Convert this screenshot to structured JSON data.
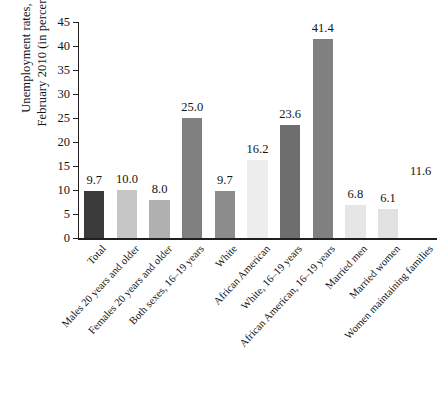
{
  "chart_data": {
    "type": "bar",
    "title": "",
    "xlabel": "",
    "ylabel": "Unemployment rates, February 2010 (in percent)",
    "ylabel_lines": [
      "Unemployment rates,",
      "February 2010 (in percent)"
    ],
    "ylim": [
      0,
      45
    ],
    "yticks": [
      0,
      5,
      10,
      15,
      20,
      25,
      30,
      35,
      40,
      45
    ],
    "ytick_labels": [
      "0",
      "5",
      "10",
      "15",
      "20",
      "25",
      "30",
      "35",
      "40",
      "45"
    ],
    "grid": false,
    "legend": false,
    "categories": [
      "Total",
      "Males 20 years and older",
      "Females 20 years and older",
      "Both sexes, 16–19 years",
      "White",
      "African American",
      "White, 16–19 years",
      "African American, 16–19 years",
      "Married men",
      "Married women",
      "Women maintaining families"
    ],
    "values": [
      9.7,
      10.0,
      8.0,
      25.0,
      9.7,
      16.2,
      23.6,
      41.4,
      6.8,
      6.1,
      11.6
    ],
    "value_labels": [
      "9.7",
      "10.0",
      "8.0",
      "25.0",
      "9.7",
      "16.2",
      "23.6",
      "41.4",
      "6.8",
      "6.1",
      "11.6"
    ],
    "bar_colors": [
      "#3b3b3b",
      "#c6c6c6",
      "#b0b0b0",
      "#808080",
      "#8c8c8c",
      "#ededed",
      "#6e6e6e",
      "#808080",
      "#e6e6e6",
      "#e2e2e2",
      "#ffffff"
    ],
    "bars_rendered": [
      true,
      true,
      true,
      true,
      true,
      true,
      true,
      true,
      true,
      true,
      false
    ],
    "axis_color": "#231f20",
    "text_color": "#141414",
    "background": "#ffffff"
  }
}
